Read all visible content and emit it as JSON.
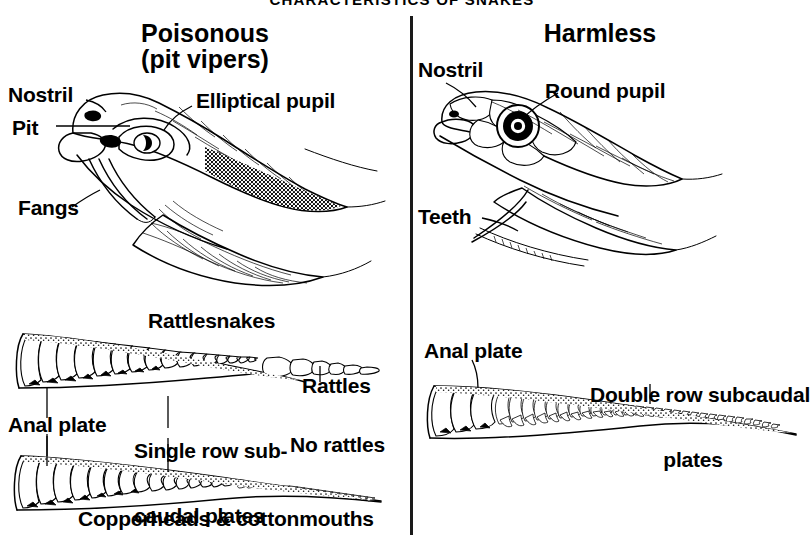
{
  "figure": {
    "title": "CHARACTERISTICS OF SNAKES",
    "columns": [
      {
        "id": "poisonous",
        "heading_line1": "Poisonous",
        "heading_line2": "(pit vipers)"
      },
      {
        "id": "harmless",
        "heading_line1": "Harmless",
        "heading_line2": ""
      }
    ]
  },
  "poisonous": {
    "head": {
      "nostril": "Nostril",
      "pit": "Pit",
      "fangs": "Fangs",
      "pupil": "Elliptical pupil"
    },
    "tails": {
      "rattlesnakes": "Rattlesnakes",
      "rattles": "Rattles",
      "anal_plate": "Anal plate",
      "subcaudal_line1": "Single row sub-",
      "subcaudal_line2": "caudal plates",
      "no_rattles": "No rattles",
      "copperheads": "Copperheads & cottonmouths"
    }
  },
  "harmless": {
    "head": {
      "nostril": "Nostril",
      "pupil": "Round pupil",
      "teeth": "Teeth"
    },
    "tail": {
      "anal_plate": "Anal plate",
      "subcaudal_line1": "Double row subcaudal",
      "subcaudal_line2": "plates"
    }
  },
  "colors": {
    "ink": "#000000",
    "paper": "#ffffff"
  }
}
